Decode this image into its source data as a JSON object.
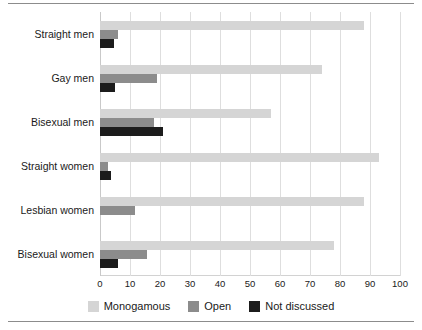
{
  "chart_data": {
    "type": "bar",
    "orientation": "horizontal",
    "title": "",
    "subtitle": "",
    "xlabel": "",
    "ylabel": "",
    "xlim": [
      0,
      100
    ],
    "xticks": [
      0,
      10,
      20,
      30,
      40,
      50,
      60,
      70,
      80,
      90,
      100
    ],
    "xtick_labels": [
      "0",
      "10",
      "20",
      "30",
      "40",
      "50",
      "60",
      "70",
      "80",
      "90",
      "100"
    ],
    "grid": true,
    "grid_axis": "x",
    "legend_position": "bottom",
    "categories": [
      "Straight men",
      "Gay men",
      "Bisexual men",
      "Straight women",
      "Lesbian women",
      "Bisexual women"
    ],
    "series": [
      {
        "name": "Monogamous",
        "color": "#d5d5d5",
        "values": [
          88,
          74,
          57,
          93,
          88,
          78
        ]
      },
      {
        "name": "Open",
        "color": "#8c8c8c",
        "values": [
          6,
          19,
          18,
          2.5,
          11.5,
          15.5
        ]
      },
      {
        "name": "Not discussed",
        "color": "#1c1c1c",
        "values": [
          4.5,
          5,
          21,
          3.5,
          0,
          6
        ]
      }
    ]
  },
  "legend": {
    "items": [
      {
        "label": "Monogamous",
        "color": "#d5d5d5"
      },
      {
        "label": "Open",
        "color": "#8c8c8c"
      },
      {
        "label": "Not discussed",
        "color": "#1c1c1c"
      }
    ]
  },
  "colors": {
    "monogamous": "#d5d5d5",
    "open": "#8c8c8c",
    "not_discussed": "#1c1c1c",
    "gridline": "#dedede",
    "rule": "#8c8c8c",
    "text": "#1a1a1a"
  }
}
